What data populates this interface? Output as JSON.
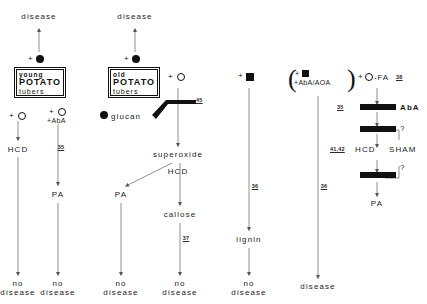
{
  "figure": {
    "type": "pathway-diagram",
    "title": "",
    "symbols": {
      "filled_circle": "elicitor (filled circle)",
      "open_circle": "open circle",
      "filled_square": "filled square",
      "plus": "+"
    }
  },
  "columns": [
    {
      "id": "young-tubers",
      "top_outcome": "disease",
      "inducer": "+",
      "box": {
        "line1": "young",
        "line2": "POTATO",
        "line3": "tubers"
      },
      "branches": [
        {
          "treatment_plus": "+",
          "treatment_symbol": "open-circle",
          "treatment_extra": "",
          "node": "HCD",
          "ref": "",
          "outcome_line1": "no",
          "outcome_line2": "disease"
        },
        {
          "treatment_plus": "+",
          "treatment_symbol": "open-circle",
          "treatment_extra": "+AbA",
          "node": "PA",
          "ref": "35",
          "outcome_line1": "no",
          "outcome_line2": "disease"
        }
      ]
    },
    {
      "id": "old-tubers",
      "top_outcome": "disease",
      "inducer": "+",
      "box": {
        "line1": "old",
        "line2": "POTATO",
        "line3": "tubers"
      },
      "glucan_label": "glucan",
      "treatment_plus": "+",
      "treatment_symbol": "open-circle",
      "superoxide_ref": "45",
      "superoxide": "superoxide",
      "node": "HCD",
      "branches": [
        {
          "node": "PA",
          "outcome_line1": "no",
          "outcome_line2": "disease",
          "ref": ""
        },
        {
          "node": "callose",
          "outcome_line1": "no",
          "outcome_line2": "disease",
          "ref": "37"
        }
      ]
    },
    {
      "id": "lignin-column",
      "treatment_plus": "+",
      "treatment_symbol": "filled-square",
      "ref": "36",
      "node": "lignin",
      "outcome_line1": "no",
      "outcome_line2": "disease"
    },
    {
      "id": "abaaoa-column",
      "treatment_plus": "+",
      "treatment_symbol": "filled-square",
      "treatment_line2": "+AbA/AOA",
      "parenthesized": true,
      "ref": "36",
      "outcome": "disease"
    },
    {
      "id": "fa-column",
      "treatment_plus": "+",
      "treatment_symbol": "open-circle",
      "treatment_text": "-FA",
      "treatment_ref": "38",
      "blocks": [
        {
          "ref": "35",
          "blocked_label": "AbA"
        },
        {
          "ref": "",
          "blocked_label": ""
        }
      ],
      "node_ref": "41,42",
      "node": "HCD",
      "sham_label": "SHAM",
      "question_mark_upper": "?",
      "question_mark_lower": "?",
      "terminal": "PA"
    }
  ],
  "labels": {
    "disease": "disease",
    "no": "no",
    "hcd": "HCD",
    "pa": "PA",
    "callose": "callose",
    "lignin": "lignin",
    "superoxide": "superoxide",
    "glucan": "glucan",
    "aba": "AbA",
    "sham": "SHAM",
    "fa": "-FA",
    "abaaoa": "+AbA/AOA",
    "plusaba": "+AbA",
    "plus": "+",
    "question": "?"
  },
  "refs": {
    "r35": "35",
    "r36": "36",
    "r37": "37",
    "r38": "38",
    "r45": "45",
    "r4142": "41,42"
  },
  "colors": {
    "ink": "#111111",
    "line": "#8a8a8a",
    "background": "#ffffff"
  }
}
